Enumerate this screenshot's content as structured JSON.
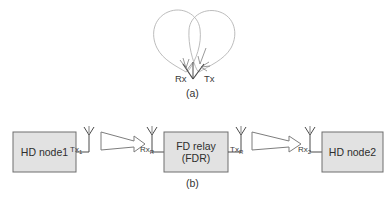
{
  "figure": {
    "panels": [
      {
        "id": "a",
        "caption": "(a)",
        "description": "full-duplex antenna pair with radiation lobes",
        "antennas": [
          {
            "name": "rx-antenna",
            "label": "Rx"
          },
          {
            "name": "tx-antenna",
            "label": "Tx"
          }
        ],
        "lobes": 2
      },
      {
        "id": "b",
        "caption": "(b)",
        "description": "half-duplex node to full-duplex relay to half-duplex node chain",
        "nodes": [
          {
            "name": "hd-node-1",
            "line1": "HD node1",
            "line2": ""
          },
          {
            "name": "fd-relay",
            "line1": "FD relay",
            "line2": "(FDR)"
          },
          {
            "name": "hd-node-2",
            "line1": "HD node2",
            "line2": ""
          }
        ],
        "antennas": [
          {
            "name": "tx1-antenna",
            "base": "Tx",
            "sub": "1"
          },
          {
            "name": "rxr-antenna",
            "base": "Rx",
            "sub": "R"
          },
          {
            "name": "txr-antenna",
            "base": "Tx",
            "sub": "R"
          },
          {
            "name": "rx2-antenna",
            "base": "Rx",
            "sub": "2"
          }
        ],
        "links": [
          {
            "name": "link-node1-to-relay",
            "from": "Tx1",
            "to": "RxR"
          },
          {
            "name": "link-relay-to-node2",
            "from": "TxR",
            "to": "Rx2"
          }
        ]
      }
    ]
  },
  "colors": {
    "box_fill": "#e2e2e2",
    "box_stroke": "#6e6e6e",
    "line": "#4a4a4a",
    "lobe_stroke": "#b0b0b0",
    "arrow_stroke": "#7a7a7a",
    "text": "#2e2e2e",
    "background": "#ffffff"
  }
}
